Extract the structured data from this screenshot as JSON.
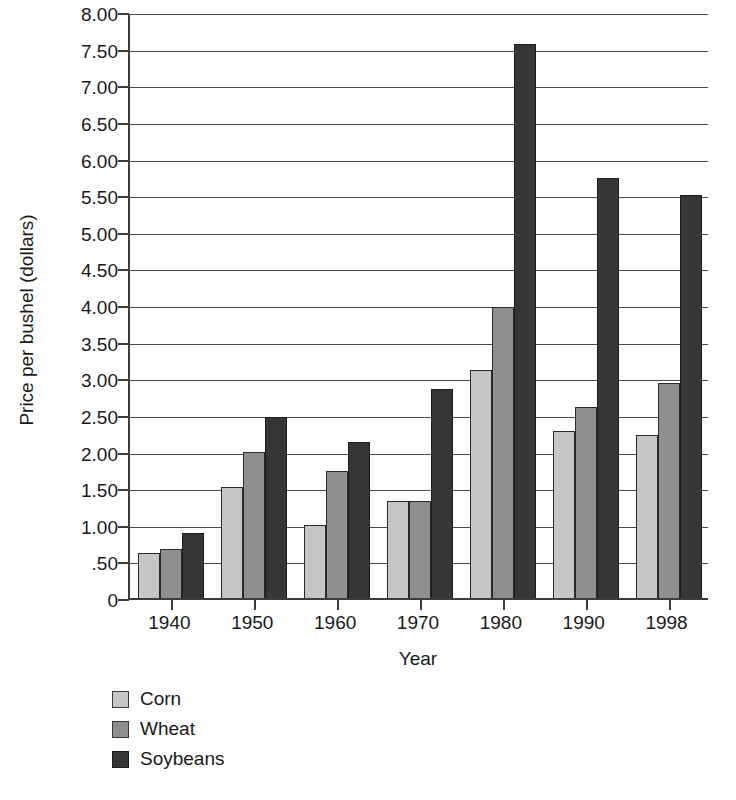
{
  "chart_data": {
    "type": "bar",
    "title": "",
    "xlabel": "Year",
    "ylabel": "Price per bushel (dollars)",
    "categories": [
      "1940",
      "1950",
      "1960",
      "1970",
      "1980",
      "1990",
      "1998"
    ],
    "series": [
      {
        "name": "Corn",
        "color": "#c6c6c6",
        "values": [
          0.62,
          1.52,
          1.0,
          1.33,
          3.11,
          2.28,
          2.22
        ]
      },
      {
        "name": "Wheat",
        "color": "#8f8f8f",
        "values": [
          0.67,
          2.0,
          1.74,
          1.33,
          3.97,
          2.61,
          2.94
        ]
      },
      {
        "name": "Soybeans",
        "color": "#363636",
        "values": [
          0.89,
          2.47,
          2.13,
          2.85,
          7.57,
          5.74,
          5.5
        ]
      }
    ],
    "ylim": [
      0,
      8.0
    ],
    "ytick_values": [
      8.0,
      7.5,
      7.0,
      6.5,
      6.0,
      5.5,
      5.0,
      4.5,
      4.0,
      3.5,
      3.0,
      2.5,
      2.0,
      1.5,
      1.0,
      0.5,
      0
    ],
    "ytick_labels": [
      "8.00",
      "7.50",
      "7.00",
      "6.50",
      "6.00",
      "5.50",
      "5.00",
      "4.50",
      "4.00",
      "3.50",
      "3.00",
      "2.50",
      "2.00",
      "1.50",
      "1.00",
      ".50",
      "0"
    ],
    "grid": true,
    "legend_position": "below-left",
    "legend": [
      "Corn",
      "Wheat",
      "Soybeans"
    ]
  }
}
